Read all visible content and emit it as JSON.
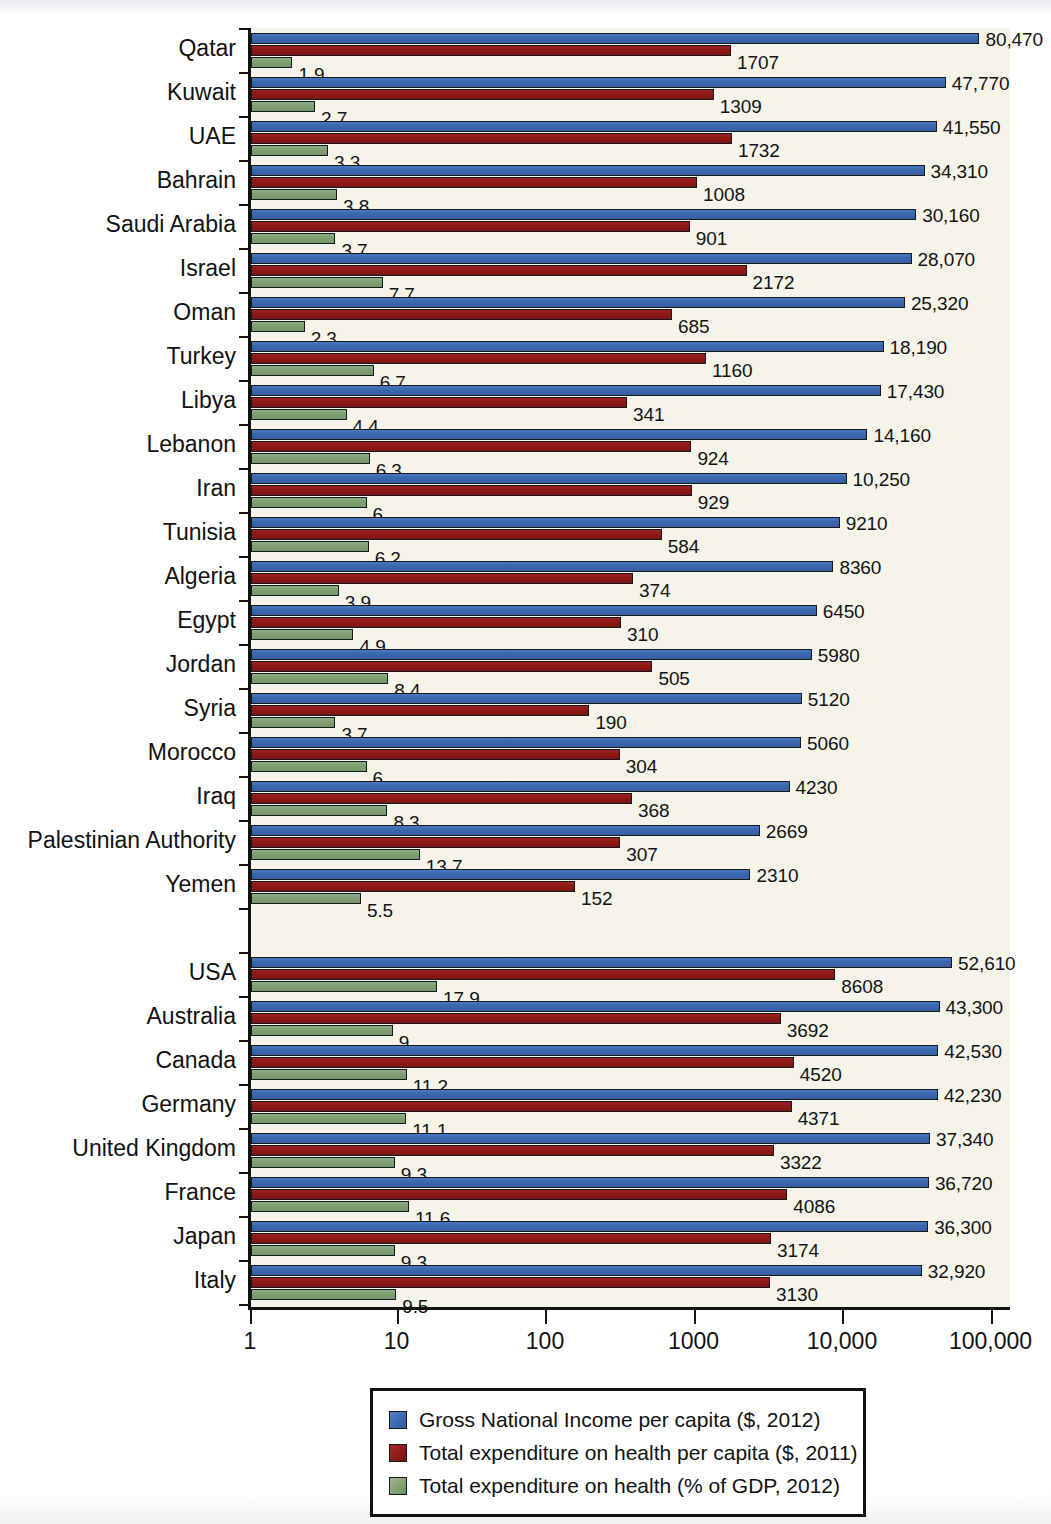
{
  "chart_data": {
    "type": "bar",
    "orientation": "horizontal",
    "title": "",
    "xlabel": "",
    "ylabel": "",
    "xscale": "log",
    "xlim": [
      1,
      100000
    ],
    "grid": false,
    "legend_position": "bottom-center",
    "xticks": [
      {
        "value": 1,
        "label": "1"
      },
      {
        "value": 10,
        "label": "10"
      },
      {
        "value": 100,
        "label": "100"
      },
      {
        "value": 1000,
        "label": "1000"
      },
      {
        "value": 10000,
        "label": "10,000"
      },
      {
        "value": 100000,
        "label": "100,000"
      }
    ],
    "series": [
      {
        "key": "gni",
        "name": "Gross National Income per capita ($, 2012)",
        "color": "#3a68b0"
      },
      {
        "key": "thexp",
        "name": "Total expenditure on health per capita ($, 2011)",
        "color": "#8d1a18"
      },
      {
        "key": "gdp",
        "name": "Total expenditure on health (% of GDP, 2012)",
        "color": "#80a074"
      }
    ],
    "categories": [
      "Qatar",
      "Kuwait",
      "UAE",
      "Bahrain",
      "Saudi Arabia",
      "Israel",
      "Oman",
      "Turkey",
      "Libya",
      "Lebanon",
      "Iran",
      "Tunisia",
      "Algeria",
      "Egypt",
      "Jordan",
      "Syria",
      "Morocco",
      "Iraq",
      "Palestinian Authority",
      "Yemen",
      "USA",
      "Australia",
      "Canada",
      "Germany",
      "United Kingdom",
      "France",
      "Japan",
      "Italy"
    ],
    "rows": [
      {
        "country": "Qatar",
        "gni": 80470,
        "gni_label": "80,470",
        "thexp": 1707,
        "thexp_label": "1707",
        "gdp": 1.9,
        "gdp_label": "1.9"
      },
      {
        "country": "Kuwait",
        "gni": 47770,
        "gni_label": "47,770",
        "thexp": 1309,
        "thexp_label": "1309",
        "gdp": 2.7,
        "gdp_label": "2.7"
      },
      {
        "country": "UAE",
        "gni": 41550,
        "gni_label": "41,550",
        "thexp": 1732,
        "thexp_label": "1732",
        "gdp": 3.3,
        "gdp_label": "3.3"
      },
      {
        "country": "Bahrain",
        "gni": 34310,
        "gni_label": "34,310",
        "thexp": 1008,
        "thexp_label": "1008",
        "gdp": 3.8,
        "gdp_label": "3.8"
      },
      {
        "country": "Saudi Arabia",
        "gni": 30160,
        "gni_label": "30,160",
        "thexp": 901,
        "thexp_label": "901",
        "gdp": 3.7,
        "gdp_label": "3.7"
      },
      {
        "country": "Israel",
        "gni": 28070,
        "gni_label": "28,070",
        "thexp": 2172,
        "thexp_label": "2172",
        "gdp": 7.7,
        "gdp_label": "7.7"
      },
      {
        "country": "Oman",
        "gni": 25320,
        "gni_label": "25,320",
        "thexp": 685,
        "thexp_label": "685",
        "gdp": 2.3,
        "gdp_label": "2.3"
      },
      {
        "country": "Turkey",
        "gni": 18190,
        "gni_label": "18,190",
        "thexp": 1160,
        "thexp_label": "1160",
        "gdp": 6.7,
        "gdp_label": "6.7"
      },
      {
        "country": "Libya",
        "gni": 17430,
        "gni_label": "17,430",
        "thexp": 341,
        "thexp_label": "341",
        "gdp": 4.4,
        "gdp_label": "4.4"
      },
      {
        "country": "Lebanon",
        "gni": 14160,
        "gni_label": "14,160",
        "thexp": 924,
        "thexp_label": "924",
        "gdp": 6.3,
        "gdp_label": "6.3"
      },
      {
        "country": "Iran",
        "gni": 10250,
        "gni_label": "10,250",
        "thexp": 929,
        "thexp_label": "929",
        "gdp": 6,
        "gdp_label": "6"
      },
      {
        "country": "Tunisia",
        "gni": 9210,
        "gni_label": "9210",
        "thexp": 584,
        "thexp_label": "584",
        "gdp": 6.2,
        "gdp_label": "6.2"
      },
      {
        "country": "Algeria",
        "gni": 8360,
        "gni_label": "8360",
        "thexp": 374,
        "thexp_label": "374",
        "gdp": 3.9,
        "gdp_label": "3.9"
      },
      {
        "country": "Egypt",
        "gni": 6450,
        "gni_label": "6450",
        "thexp": 310,
        "thexp_label": "310",
        "gdp": 4.9,
        "gdp_label": "4.9"
      },
      {
        "country": "Jordan",
        "gni": 5980,
        "gni_label": "5980",
        "thexp": 505,
        "thexp_label": "505",
        "gdp": 8.4,
        "gdp_label": "8.4"
      },
      {
        "country": "Syria",
        "gni": 5120,
        "gni_label": "5120",
        "thexp": 190,
        "thexp_label": "190",
        "gdp": 3.7,
        "gdp_label": "3.7"
      },
      {
        "country": "Morocco",
        "gni": 5060,
        "gni_label": "5060",
        "thexp": 304,
        "thexp_label": "304",
        "gdp": 6,
        "gdp_label": "6"
      },
      {
        "country": "Iraq",
        "gni": 4230,
        "gni_label": "4230",
        "thexp": 368,
        "thexp_label": "368",
        "gdp": 8.3,
        "gdp_label": "8.3"
      },
      {
        "country": "Palestinian Authority",
        "gni": 2669,
        "gni_label": "2669",
        "thexp": 307,
        "thexp_label": "307",
        "gdp": 13.7,
        "gdp_label": "13.7"
      },
      {
        "country": "Yemen",
        "gni": 2310,
        "gni_label": "2310",
        "thexp": 152,
        "thexp_label": "152",
        "gdp": 5.5,
        "gdp_label": "5.5"
      },
      {
        "country": "",
        "gni": null,
        "gni_label": "",
        "thexp": null,
        "thexp_label": "",
        "gdp": null,
        "gdp_label": ""
      },
      {
        "country": "USA",
        "gni": 52610,
        "gni_label": "52,610",
        "thexp": 8608,
        "thexp_label": "8608",
        "gdp": 17.9,
        "gdp_label": "17.9"
      },
      {
        "country": "Australia",
        "gni": 43300,
        "gni_label": "43,300",
        "thexp": 3692,
        "thexp_label": "3692",
        "gdp": 9,
        "gdp_label": "9"
      },
      {
        "country": "Canada",
        "gni": 42530,
        "gni_label": "42,530",
        "thexp": 4520,
        "thexp_label": "4520",
        "gdp": 11.2,
        "gdp_label": "11.2"
      },
      {
        "country": "Germany",
        "gni": 42230,
        "gni_label": "42,230",
        "thexp": 4371,
        "thexp_label": "4371",
        "gdp": 11.1,
        "gdp_label": "11.1"
      },
      {
        "country": "United Kingdom",
        "gni": 37340,
        "gni_label": "37,340",
        "thexp": 3322,
        "thexp_label": "3322",
        "gdp": 9.3,
        "gdp_label": "9.3"
      },
      {
        "country": "France",
        "gni": 36720,
        "gni_label": "36,720",
        "thexp": 4086,
        "thexp_label": "4086",
        "gdp": 11.6,
        "gdp_label": "11.6"
      },
      {
        "country": "Japan",
        "gni": 36300,
        "gni_label": "36,300",
        "thexp": 3174,
        "thexp_label": "3174",
        "gdp": 9.3,
        "gdp_label": "9.3"
      },
      {
        "country": "Italy",
        "gni": 32920,
        "gni_label": "32,920",
        "thexp": 3130,
        "thexp_label": "3130",
        "gdp": 9.5,
        "gdp_label": "9.5"
      }
    ]
  },
  "legend": {
    "items": [
      {
        "label": "Gross National Income per capita ($, 2012)",
        "color": "#3a68b0",
        "swatch": "sw-gni"
      },
      {
        "label": "Total expenditure on health per capita ($, 2011)",
        "color": "#8d1a18",
        "swatch": "sw-thexp"
      },
      {
        "label": "Total expenditure on health (% of GDP, 2012)",
        "color": "#80a074",
        "swatch": "sw-gdp"
      }
    ]
  }
}
